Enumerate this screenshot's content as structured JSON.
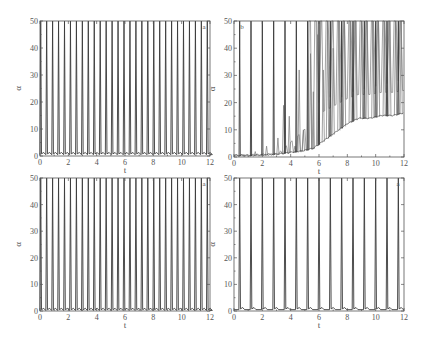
{
  "chart_data": [
    {
      "id": "top-left",
      "type": "line",
      "panel_label": "a",
      "xlabel": "t",
      "ylabel": "α",
      "xlim": [
        0,
        12
      ],
      "ylim": [
        0,
        50
      ],
      "xticks": [
        0,
        2,
        4,
        6,
        8,
        10,
        12
      ],
      "yticks": [
        0,
        10,
        20,
        30,
        40,
        50
      ],
      "grid": false,
      "description": "Regular periodic spiking; spikes reach/clip at 50, baseline near 0",
      "spike_start": 0.05,
      "spike_period": 0.42,
      "spike_count": 29,
      "spike_height": 50,
      "baseline": 0.5,
      "box": {
        "x0": 40,
        "x1": 210,
        "y0": 21,
        "y1": 156
      }
    },
    {
      "id": "top-right",
      "type": "line",
      "panel_label": "b",
      "xlabel": "t",
      "ylabel": "α",
      "xlim": [
        0,
        12
      ],
      "ylim": [
        0,
        50
      ],
      "xticks": [
        0,
        2,
        4,
        6,
        8,
        10,
        12
      ],
      "yticks": [
        0,
        10,
        20,
        30,
        40,
        50
      ],
      "grid": false,
      "description": "Main spikes every ~0.8 with growing secondary oscillations; minima rise from ~0 to ~30 by t=12",
      "main_spikes_t": [
        0.4,
        1.2,
        2.0,
        2.8,
        3.6,
        4.4,
        5.2,
        6.0,
        6.8,
        7.6,
        8.4,
        9.2,
        10.0,
        10.8,
        11.6
      ],
      "secondary_peaks": [
        {
          "t": 0.7,
          "y": 1
        },
        {
          "t": 1.5,
          "y": 2
        },
        {
          "t": 2.3,
          "y": 4
        },
        {
          "t": 3.1,
          "y": 7
        },
        {
          "t": 3.5,
          "y": 19
        },
        {
          "t": 3.9,
          "y": 15
        },
        {
          "t": 4.3,
          "y": 4
        },
        {
          "t": 4.6,
          "y": 32
        },
        {
          "t": 4.9,
          "y": 10
        },
        {
          "t": 5.4,
          "y": 38
        },
        {
          "t": 5.6,
          "y": 24
        },
        {
          "t": 5.9,
          "y": 45
        },
        {
          "t": 6.3,
          "y": 32
        },
        {
          "t": 6.6,
          "y": 50
        },
        {
          "t": 7.0,
          "y": 40
        },
        {
          "t": 7.4,
          "y": 50
        },
        {
          "t": 7.8,
          "y": 50
        },
        {
          "t": 8.2,
          "y": 50
        },
        {
          "t": 8.6,
          "y": 50
        },
        {
          "t": 9.0,
          "y": 50
        },
        {
          "t": 9.4,
          "y": 50
        },
        {
          "t": 9.8,
          "y": 50
        },
        {
          "t": 10.2,
          "y": 50
        },
        {
          "t": 10.6,
          "y": 50
        },
        {
          "t": 11.0,
          "y": 50
        },
        {
          "t": 11.4,
          "y": 50
        },
        {
          "t": 11.8,
          "y": 50
        }
      ],
      "troughs": [
        {
          "t": 0.0,
          "y": 0.3
        },
        {
          "t": 1.0,
          "y": 0.3
        },
        {
          "t": 2.0,
          "y": 0.5
        },
        {
          "t": 3.0,
          "y": 0.8
        },
        {
          "t": 4.0,
          "y": 1.5
        },
        {
          "t": 4.8,
          "y": 2
        },
        {
          "t": 5.6,
          "y": 3
        },
        {
          "t": 6.4,
          "y": 6
        },
        {
          "t": 7.2,
          "y": 9
        },
        {
          "t": 8.0,
          "y": 12
        },
        {
          "t": 8.8,
          "y": 14
        },
        {
          "t": 9.6,
          "y": 14
        },
        {
          "t": 10.4,
          "y": 15
        },
        {
          "t": 11.2,
          "y": 15
        },
        {
          "t": 12.0,
          "y": 16
        }
      ],
      "upper_troughs": [
        {
          "t": 6.0,
          "y": 20
        },
        {
          "t": 6.8,
          "y": 22
        },
        {
          "t": 7.6,
          "y": 22
        },
        {
          "t": 8.4,
          "y": 24
        },
        {
          "t": 9.2,
          "y": 25
        },
        {
          "t": 10.0,
          "y": 26
        },
        {
          "t": 10.8,
          "y": 27
        },
        {
          "t": 11.6,
          "y": 28
        }
      ],
      "box": {
        "x0": 234,
        "x1": 404,
        "y0": 21,
        "y1": 157
      }
    },
    {
      "id": "bottom-left",
      "type": "line",
      "panel_label": "a",
      "xlabel": "t",
      "ylabel": "α",
      "xlim": [
        0,
        12
      ],
      "ylim": [
        0,
        50
      ],
      "xticks": [
        0,
        2,
        4,
        6,
        8,
        10,
        12
      ],
      "yticks": [
        0,
        10,
        20,
        30,
        40,
        50
      ],
      "grid": false,
      "description": "Regular periodic spiking at ~0.42 period, baseline ~0",
      "spike_start": 0.05,
      "spike_period": 0.42,
      "spike_count": 29,
      "spike_height": 50,
      "baseline": 0.2,
      "box": {
        "x0": 40,
        "x1": 210,
        "y0": 178,
        "y1": 311
      }
    },
    {
      "id": "bottom-right",
      "type": "line",
      "panel_label": "a",
      "xlabel": "t",
      "ylabel": "α",
      "xlim": [
        0,
        12
      ],
      "ylim": [
        0,
        50
      ],
      "xticks": [
        0,
        2,
        4,
        6,
        8,
        10,
        12
      ],
      "yticks": [
        0,
        10,
        20,
        30,
        40,
        50
      ],
      "grid": false,
      "description": "Regular spiking with period ~0.8, small ripples near baseline",
      "spike_start": 0.4,
      "spike_period": 0.8,
      "spike_count": 15,
      "spike_height": 50,
      "baseline": 0.5,
      "box": {
        "x0": 234,
        "x1": 404,
        "y0": 178,
        "y1": 311
      }
    }
  ]
}
